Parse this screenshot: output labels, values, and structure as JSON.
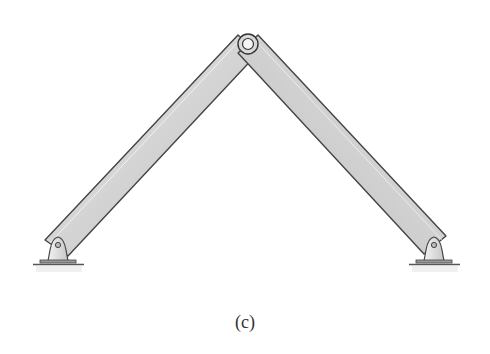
{
  "figure": {
    "caption": "(c)",
    "colors": {
      "beam_fill": "#d6d6d6",
      "beam_edge": "#444444",
      "beam_highlight": "#efefef",
      "support_fill": "#e4e4e4",
      "ground": "#555555"
    },
    "joints": {
      "left_support": [
        58,
        245
      ],
      "apex": [
        248,
        44
      ],
      "right_support": [
        434,
        245
      ]
    }
  }
}
